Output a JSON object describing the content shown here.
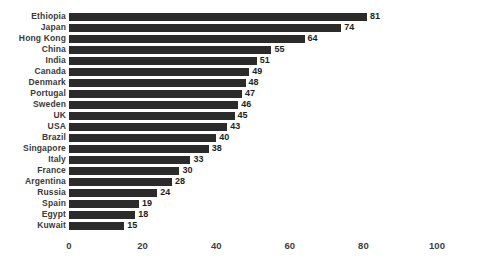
{
  "chart_data": {
    "type": "bar",
    "orientation": "horizontal",
    "title": "",
    "subtitle": "",
    "xlabel": "",
    "ylabel": "",
    "xlim": [
      0,
      100
    ],
    "xticks": [
      0,
      20,
      40,
      60,
      80,
      100
    ],
    "xtick_labels": [
      "0",
      "20",
      "40",
      "60",
      "80",
      "100"
    ],
    "grid": false,
    "legend": null,
    "bar_color": "#2b2b2b",
    "label_color": "#3a3a3a",
    "value_label_color": "#1e1e1e",
    "background_color": "#ffffff",
    "data_labels_shown": true,
    "categories": [
      "Ethiopia",
      "Japan",
      "Hong Kong",
      "China",
      "India",
      "Canada",
      "Denmark",
      "Portugal",
      "Sweden",
      "UK",
      "USA",
      "Brazil",
      "Singapore",
      "Italy",
      "France",
      "Argentina",
      "Russia",
      "Spain",
      "Egypt",
      "Kuwait"
    ],
    "values": [
      81,
      74,
      64,
      55,
      51,
      49,
      48,
      47,
      46,
      45,
      43,
      40,
      38,
      33,
      30,
      28,
      24,
      19,
      18,
      15
    ]
  }
}
